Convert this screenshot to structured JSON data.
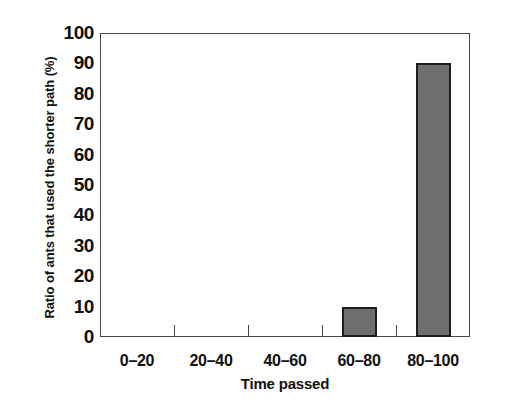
{
  "chart_data": {
    "type": "bar",
    "title": "",
    "categories": [
      "0–20",
      "20–40",
      "40–60",
      "60–80",
      "80–100"
    ],
    "values": [
      0,
      0,
      0,
      10,
      90
    ],
    "xlabel": "Time passed",
    "ylabel": "Ratio of ants that used the shorter path (%)",
    "ylim": [
      0,
      100
    ],
    "ytick_labels": [
      "100",
      "90",
      "80",
      "70",
      "60",
      "50",
      "40",
      "30",
      "20",
      "10",
      "0"
    ],
    "ytick_values": [
      100,
      90,
      80,
      70,
      60,
      50,
      40,
      30,
      20,
      10,
      0
    ],
    "ytick_step": 10,
    "grid": false,
    "legend": null,
    "bar_fill_color": "#6e6e6e",
    "bar_border_color": "#1d1d1d",
    "axis_color": "#4a4a4a",
    "background_color": "#ffffff"
  }
}
